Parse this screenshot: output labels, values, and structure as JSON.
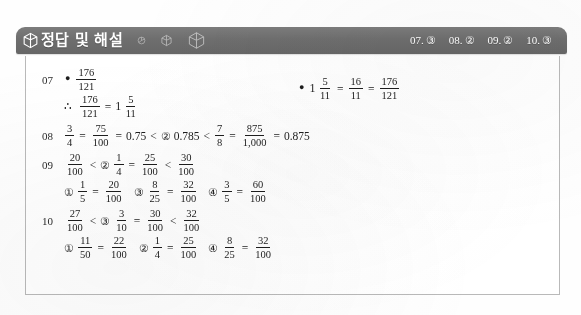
{
  "header": {
    "title": "정답 및 해설",
    "logo_icon": "cube-outline-icon",
    "deco_icons": [
      "small-polygon-icon",
      "polygon-outline-icon",
      "cube-outline-icon"
    ],
    "answers": [
      {
        "number": "07.",
        "choice": "③"
      },
      {
        "number": "08.",
        "choice": "②"
      },
      {
        "number": "09.",
        "choice": "②"
      },
      {
        "number": "10.",
        "choice": "③"
      }
    ]
  },
  "solutions": [
    {
      "number": "07",
      "lines": [
        {
          "prefix": "•",
          "atoms": [
            {
              "t": "frac",
              "n": "176",
              "d": "121"
            }
          ]
        },
        {
          "prefix": "∴",
          "atoms": [
            {
              "t": "frac",
              "n": "176",
              "d": "121"
            },
            {
              "t": "op",
              "v": "="
            },
            {
              "t": "whole",
              "v": "1"
            },
            {
              "t": "frac",
              "n": "5",
              "d": "11"
            }
          ]
        }
      ],
      "right": {
        "prefix": "•",
        "atoms": [
          {
            "t": "whole",
            "v": "1"
          },
          {
            "t": "frac",
            "n": "5",
            "d": "11"
          },
          {
            "t": "op",
            "v": "="
          },
          {
            "t": "frac",
            "n": "16",
            "d": "11"
          },
          {
            "t": "op",
            "v": "="
          },
          {
            "t": "frac",
            "n": "176",
            "d": "121"
          }
        ]
      }
    },
    {
      "number": "08",
      "lines": [
        {
          "atoms": [
            {
              "t": "frac",
              "n": "3",
              "d": "4"
            },
            {
              "t": "op",
              "v": "="
            },
            {
              "t": "frac",
              "n": "75",
              "d": "100"
            },
            {
              "t": "op",
              "v": "="
            },
            {
              "t": "plain",
              "v": "0.75"
            },
            {
              "t": "op",
              "v": "<"
            },
            {
              "t": "choice",
              "v": "②"
            },
            {
              "t": "plain",
              "v": "0.785"
            },
            {
              "t": "op",
              "v": "<"
            },
            {
              "t": "frac",
              "n": "7",
              "d": "8"
            },
            {
              "t": "op",
              "v": "="
            },
            {
              "t": "frac",
              "n": "875",
              "d": "1,000"
            },
            {
              "t": "op",
              "v": "="
            },
            {
              "t": "plain",
              "v": "0.875"
            }
          ]
        }
      ]
    },
    {
      "number": "09",
      "lines": [
        {
          "atoms": [
            {
              "t": "frac",
              "n": "20",
              "d": "100"
            },
            {
              "t": "op",
              "v": "<"
            },
            {
              "t": "choice",
              "v": "②"
            },
            {
              "t": "frac",
              "n": "1",
              "d": "4"
            },
            {
              "t": "op",
              "v": "="
            },
            {
              "t": "frac",
              "n": "25",
              "d": "100"
            },
            {
              "t": "op",
              "v": "<"
            },
            {
              "t": "frac",
              "n": "30",
              "d": "100"
            }
          ]
        },
        {
          "atoms": [
            {
              "t": "choice",
              "v": "①"
            },
            {
              "t": "frac",
              "n": "1",
              "d": "5"
            },
            {
              "t": "op",
              "v": "="
            },
            {
              "t": "frac",
              "n": "20",
              "d": "100"
            },
            {
              "t": "choice-sp",
              "v": "③"
            },
            {
              "t": "frac",
              "n": "8",
              "d": "25"
            },
            {
              "t": "op",
              "v": "="
            },
            {
              "t": "frac",
              "n": "32",
              "d": "100"
            },
            {
              "t": "choice-sp",
              "v": "④"
            },
            {
              "t": "frac",
              "n": "3",
              "d": "5"
            },
            {
              "t": "op",
              "v": "="
            },
            {
              "t": "frac",
              "n": "60",
              "d": "100"
            }
          ]
        }
      ]
    },
    {
      "number": "10",
      "lines": [
        {
          "atoms": [
            {
              "t": "frac",
              "n": "27",
              "d": "100"
            },
            {
              "t": "op",
              "v": "<"
            },
            {
              "t": "choice",
              "v": "③"
            },
            {
              "t": "frac",
              "n": "3",
              "d": "10"
            },
            {
              "t": "op",
              "v": "="
            },
            {
              "t": "frac",
              "n": "30",
              "d": "100"
            },
            {
              "t": "op",
              "v": "<"
            },
            {
              "t": "frac",
              "n": "32",
              "d": "100"
            }
          ]
        },
        {
          "atoms": [
            {
              "t": "choice",
              "v": "①"
            },
            {
              "t": "frac",
              "n": "11",
              "d": "50"
            },
            {
              "t": "op",
              "v": "="
            },
            {
              "t": "frac",
              "n": "22",
              "d": "100"
            },
            {
              "t": "choice-sp",
              "v": "②"
            },
            {
              "t": "frac",
              "n": "1",
              "d": "4"
            },
            {
              "t": "op",
              "v": "="
            },
            {
              "t": "frac",
              "n": "25",
              "d": "100"
            },
            {
              "t": "choice-sp",
              "v": "④"
            },
            {
              "t": "frac",
              "n": "8",
              "d": "25"
            },
            {
              "t": "op",
              "v": "="
            },
            {
              "t": "frac",
              "n": "32",
              "d": "100"
            }
          ]
        }
      ]
    }
  ]
}
